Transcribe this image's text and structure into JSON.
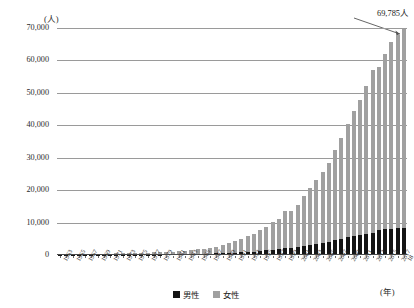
{
  "chart_data": {
    "type": "bar",
    "subtype": "stacked-vertical",
    "title": "",
    "xlabel": "(年)",
    "ylabel": "(人)",
    "ylim": [
      0,
      70000
    ],
    "yticks": [
      0,
      10000,
      20000,
      30000,
      40000,
      50000,
      60000,
      70000
    ],
    "ytick_labels": [
      "0",
      "10,000",
      "20,000",
      "30,000",
      "40,000",
      "50,000",
      "60,000",
      "70,000"
    ],
    "grid": true,
    "legend_position": "bottom-center",
    "x": [
      1963,
      1964,
      1965,
      1966,
      1967,
      1968,
      1969,
      1970,
      1971,
      1972,
      1973,
      1974,
      1975,
      1976,
      1977,
      1978,
      1979,
      1980,
      1981,
      1982,
      1983,
      1984,
      1985,
      1986,
      1987,
      1988,
      1989,
      1990,
      1991,
      1992,
      1993,
      1994,
      1995,
      1996,
      1997,
      1998,
      1999,
      2000,
      2001,
      2002,
      2003,
      2004,
      2005,
      2006,
      2007,
      2008,
      2009,
      2010,
      2011,
      2012,
      2013,
      2014,
      2015,
      2016,
      2017,
      2018
    ],
    "xtick_labels": [
      "1963",
      "1965",
      "1967",
      "1969",
      "1971",
      "1973",
      "1975",
      "1977",
      "1979",
      "1981",
      "1983",
      "1985",
      "1987",
      "1989",
      "1991",
      "1993",
      "1995",
      "1997",
      "1999",
      "2001",
      "2003",
      "2005",
      "2007",
      "2009",
      "2011",
      "2013",
      "2015",
      "2017",
      "18"
    ],
    "series": [
      {
        "name": "男性",
        "color": "#141414",
        "values": [
          20,
          23,
          36,
          37,
          43,
          54,
          59,
          62,
          70,
          77,
          85,
          96,
          102,
          108,
          119,
          132,
          144,
          174,
          202,
          233,
          269,
          304,
          359,
          400,
          462,
          517,
          556,
          680,
          740,
          822,
          923,
          1013,
          1255,
          1400,
          1570,
          1812,
          2158,
          2158,
          2541,
          2875,
          3159,
          3523,
          3779,
          4150,
          4613,
          5063,
          5447,
          5869,
          6162,
          6534,
          6791,
          7586,
          8167,
          8167,
          8197,
          8331
        ],
        "units": "人"
      },
      {
        "name": "女性",
        "color": "#a0a0a0",
        "values": [
          133,
          168,
          162,
          216,
          210,
          273,
          272,
          248,
          269,
          328,
          410,
          431,
          446,
          558,
          579,
          660,
          717,
          794,
          870,
          967,
          1085,
          1278,
          1531,
          1451,
          1847,
          2106,
          2522,
          3078,
          3625,
          4152,
          4802,
          5593,
          6378,
          7373,
          8491,
          9373,
          11346,
          11346,
          13036,
          15475,
          17402,
          19515,
          21775,
          24245,
          27682,
          30936,
          34952,
          38580,
          41594,
          45612,
          50269,
          50269,
          53728,
          57525,
          59627,
          61454
        ],
        "units": "人"
      }
    ],
    "totals": [
      153,
      191,
      198,
      253,
      253,
      327,
      331,
      310,
      339,
      405,
      495,
      527,
      548,
      666,
      698,
      792,
      861,
      968,
      1072,
      1200,
      1354,
      1582,
      1890,
      1851,
      2309,
      2623,
      3078,
      3758,
      4365,
      4974,
      5725,
      6606,
      7633,
      8773,
      10061,
      11185,
      13504,
      13504,
      15577,
      18350,
      20561,
      23038,
      25554,
      28395,
      32295,
      35999,
      40399,
      44449,
      47756,
      52146,
      57060,
      57860,
      61895,
      65692,
      67824,
      69785
    ],
    "annotations": [
      {
        "text": "69,785人",
        "target_x": 2018,
        "target_y": 69785
      }
    ]
  },
  "axis": {
    "y_unit": "(人)",
    "x_unit": "(年)"
  },
  "legend": {
    "items": [
      {
        "label": "男性",
        "color": "#141414"
      },
      {
        "label": "女性",
        "color": "#a0a0a0"
      }
    ]
  }
}
